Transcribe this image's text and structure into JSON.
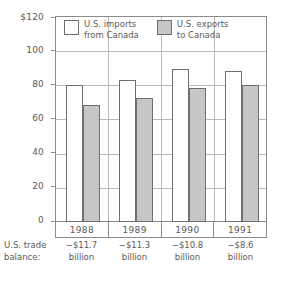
{
  "chart_data": {
    "type": "bar",
    "title": "",
    "xlabel": "",
    "ylabel": "",
    "categories": [
      "1988",
      "1989",
      "1990",
      "1991"
    ],
    "series": [
      {
        "name": "U.S. imports from Canada",
        "values": [
          80,
          83,
          89,
          88
        ],
        "color": "#ffffff"
      },
      {
        "name": "U.S. exports to Canada",
        "values": [
          68,
          72,
          78,
          80
        ],
        "color": "#c6c6c6"
      }
    ],
    "ylim": [
      0,
      120
    ],
    "yticks": [
      "0",
      "20",
      "40",
      "60",
      "80",
      "100",
      "$120"
    ],
    "ytick_values": [
      0,
      20,
      40,
      60,
      80,
      100,
      120
    ],
    "grid": true,
    "legend_position": "top-inside",
    "annotations": {
      "row_label_line1": "U.S. trade",
      "row_label_line2": "balance:",
      "row_values": [
        {
          "amount": "−$11.7",
          "unit": "billion"
        },
        {
          "amount": "−$11.3",
          "unit": "billion"
        },
        {
          "amount": "−$10.8",
          "unit": "billion"
        },
        {
          "amount": "−$8.6",
          "unit": "billion"
        }
      ]
    }
  },
  "legend": {
    "entries": [
      {
        "line1": "U.S. imports",
        "line2": "from Canada",
        "swatch": "white-swatch"
      },
      {
        "line1": "U.S. exports",
        "line2": "to Canada",
        "swatch": "gray-swatch"
      }
    ]
  },
  "colors": {
    "imports_fill": "#ffffff",
    "exports_fill": "#c6c6c6",
    "bar_stroke": "#6f6f6f",
    "grid": "#b9b9b9",
    "frame": "#8b8b8b",
    "text": "#5a5a5a"
  }
}
